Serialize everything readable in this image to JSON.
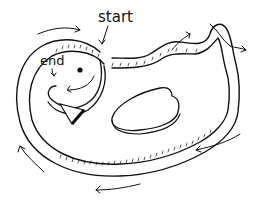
{
  "diagram": {
    "labels": {
      "start": "start",
      "end": "end"
    },
    "colors": {
      "ink": "#111111",
      "background": "#ffffff"
    }
  }
}
